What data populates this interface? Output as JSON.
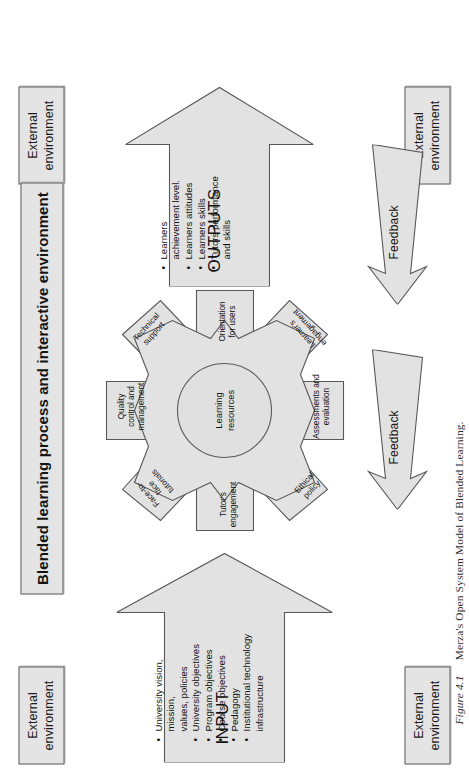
{
  "figure": {
    "number": "Figure 4.1",
    "caption": "Merza's Open System Model of Blended Learning.",
    "full_caption": "Figure 4.1   Merza's Open System Model of Blended Learning."
  },
  "colors": {
    "shape_fill": "#e2e2e2",
    "shape_stroke": "#585858",
    "box_fill": "#e4e4e4",
    "box_stroke": "#5d5d5d",
    "text": "#111111",
    "page_background": "#ffffff"
  },
  "external_environment": {
    "label": "External\nenvironment",
    "instances": [
      {
        "position": "top-left"
      },
      {
        "position": "top-right"
      },
      {
        "position": "bottom-left"
      },
      {
        "position": "bottom-right"
      }
    ]
  },
  "process_title": "Blended learning process and interactive environment",
  "input": {
    "title": "INPUT",
    "items": [
      "University vision, mission,\nvalues, policies",
      "University objectives",
      "Program objectives",
      "Course objectives",
      "Pedagogy",
      "Institutional technology\ninfrastructure"
    ]
  },
  "outputs": {
    "title": "OUTPUTS",
    "items": [
      "Learners\nachievement level.",
      "Learners attitudes",
      "Learners skills",
      "Tutors performance\nand skills"
    ]
  },
  "core": {
    "label": "Learning\nresources"
  },
  "gear_teeth": [
    {
      "id": "quality-control",
      "label": "Quality\ncontrol and\nmanagement",
      "kind": "arrow"
    },
    {
      "id": "face-to-face",
      "label": "Face-to-\nface\ntutorials",
      "kind": "diamond"
    },
    {
      "id": "tutors-engagement",
      "label": "Tutor's engagement",
      "kind": "arrow"
    },
    {
      "id": "technical-support",
      "label": "Technical\nsupport",
      "kind": "diamond"
    },
    {
      "id": "orientation-for-users",
      "label": "Orientation\nfor users",
      "kind": "arrow"
    },
    {
      "id": "learners-engagement",
      "label": "Learner's\nengagement",
      "kind": "diamond"
    },
    {
      "id": "assessments",
      "label": "Assessments and\nevaluation",
      "kind": "arrow"
    },
    {
      "id": "ethical-policy",
      "label": "Ethical\npolicy",
      "kind": "diamond"
    }
  ],
  "feedback": {
    "label": "Feedback",
    "count": 2
  }
}
